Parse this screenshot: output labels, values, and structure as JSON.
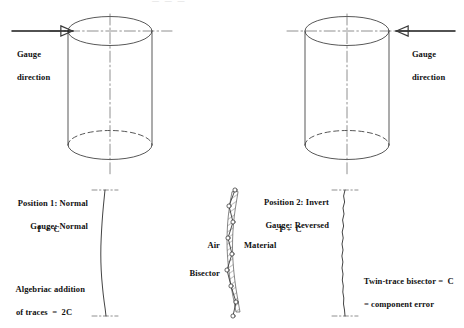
{
  "figure": {
    "title_cut_off": "— — —",
    "line_color": "#3a3a3a",
    "text_color": "#111111",
    "hatch_color": "#555555",
    "background": "#ffffff"
  },
  "left_cylinder": {
    "name": "cylinder-position-1",
    "gauge_label_line1": "Gauge",
    "gauge_label_line2": "direction",
    "arrow_direction": "right"
  },
  "right_cylinder": {
    "name": "cylinder-position-2",
    "gauge_label_line1": "Gauge",
    "gauge_label_line2": "direction",
    "arrow_direction": "left"
  },
  "left_trace": {
    "heading_line1": "Position 1: Normal",
    "heading_line2": "Gauge: Normal",
    "equation": "I + C",
    "result_line1": "Algebriac addition",
    "result_line2": "of traces  =  2C"
  },
  "center_trace": {
    "heading_line1": "Position 2: Invert",
    "heading_line2": "Gauge: Reversed",
    "equation": "-I + C",
    "label_air": "Air",
    "label_material": "Material",
    "label_bisector": "Bisector"
  },
  "right_trace": {
    "result_line1": "Twin-trace bisector =  C",
    "result_line2": "= component error"
  }
}
